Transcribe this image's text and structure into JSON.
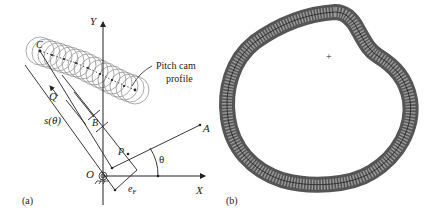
{
  "panel_a": {
    "label": "(a)",
    "axis_x": "X",
    "axis_y": "Y",
    "origin": "O",
    "point_c": "C",
    "point_q": "Q",
    "point_b": "B",
    "point_p": "P",
    "point_a": "A",
    "angle": "θ",
    "displacement": "s(θ)",
    "offset": "e",
    "offset_sub": "F",
    "callout_line1": "Pitch cam",
    "callout_line2": "profile"
  },
  "panel_b": {
    "label": "(b)",
    "center_mark": "+"
  },
  "colors": {
    "ink": "#222222",
    "circle": "#777777",
    "background": "#ffffff"
  }
}
